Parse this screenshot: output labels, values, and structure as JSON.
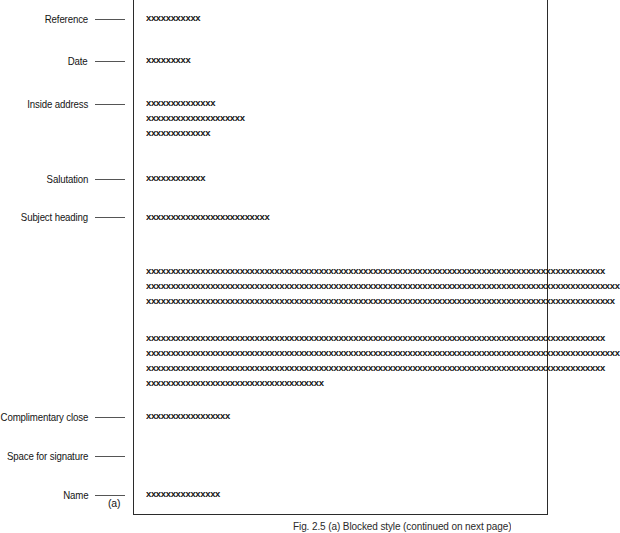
{
  "figure": {
    "subfigure_tag": "(a)",
    "caption": "Fig. 2.5 (a) Blocked style (continued on next page)",
    "line_color": "#555555",
    "border_color": "#2b2b2b",
    "text_color": "#151515"
  },
  "labels": [
    {
      "name": "reference",
      "text": "Reference",
      "top": 12
    },
    {
      "name": "date",
      "text": "Date",
      "top": 54
    },
    {
      "name": "inside-address",
      "text": "Inside address",
      "top": 97
    },
    {
      "name": "salutation",
      "text": "Salutation",
      "top": 172
    },
    {
      "name": "subject-heading",
      "text": "Subject heading",
      "top": 210
    },
    {
      "name": "complimentary-close",
      "text": "Complimentary close",
      "top": 410
    },
    {
      "name": "space-for-signature",
      "text": "Space for signature",
      "top": 449
    },
    {
      "name": "name",
      "text": "Name",
      "top": 488
    }
  ],
  "letter_lines": [
    {
      "name": "reference-line",
      "text": "xxxxxxxxxxx",
      "top": 14
    },
    {
      "name": "date-line",
      "text": "xxxxxxxxx",
      "top": 56
    },
    {
      "name": "inside-address-line-1",
      "text": "xxxxxxxxxxxxxx",
      "top": 99
    },
    {
      "name": "inside-address-line-2",
      "text": "xxxxxxxxxxxxxxxxxxxx",
      "top": 114
    },
    {
      "name": "inside-address-line-3",
      "text": "xxxxxxxxxxxxx",
      "top": 129
    },
    {
      "name": "salutation-line",
      "text": "xxxxxxxxxxxx",
      "top": 174
    },
    {
      "name": "subject-heading-line",
      "text": "xxxxxxxxxxxxxxxxxxxxxxxxx",
      "top": 213
    },
    {
      "name": "body1-line-1",
      "text": "xxxxxxxxxxxxxxxxxxxxxxxxxxxxxxxxxxxxxxxxxxxxxxxxxxxxxxxxxxxxxxxxxxxxxxxxxxxxxxxxxxxxxxxxxxxxx",
      "top": 267
    },
    {
      "name": "body1-line-2",
      "text": "xxxxxxxxxxxxxxxxxxxxxxxxxxxxxxxxxxxxxxxxxxxxxxxxxxxxxxxxxxxxxxxxxxxxxxxxxxxxxxxxxxxxxxxxxxxxxxxx",
      "top": 282
    },
    {
      "name": "body1-line-3",
      "text": "xxxxxxxxxxxxxxxxxxxxxxxxxxxxxxxxxxxxxxxxxxxxxxxxxxxxxxxxxxxxxxxxxxxxxxxxxxxxxxxxxxxxxxxxxxxxxxx",
      "top": 297
    },
    {
      "name": "body2-line-1",
      "text": "xxxxxxxxxxxxxxxxxxxxxxxxxxxxxxxxxxxxxxxxxxxxxxxxxxxxxxxxxxxxxxxxxxxxxxxxxxxxxxxxxxxxxxxxxxxxx",
      "top": 334
    },
    {
      "name": "body2-line-2",
      "text": "xxxxxxxxxxxxxxxxxxxxxxxxxxxxxxxxxxxxxxxxxxxxxxxxxxxxxxxxxxxxxxxxxxxxxxxxxxxxxxxxxxxxxxxxxxxxxxxx",
      "top": 349
    },
    {
      "name": "body2-line-3",
      "text": "xxxxxxxxxxxxxxxxxxxxxxxxxxxxxxxxxxxxxxxxxxxxxxxxxxxxxxxxxxxxxxxxxxxxxxxxxxxxxxxxxxxxxxxxxxxxx",
      "top": 364
    },
    {
      "name": "body2-line-4",
      "text": "xxxxxxxxxxxxxxxxxxxxxxxxxxxxxxxxxxxx",
      "top": 379
    },
    {
      "name": "complimentary-close-line",
      "text": "xxxxxxxxxxxxxxxxx",
      "top": 412
    },
    {
      "name": "name-line",
      "text": "xxxxxxxxxxxxxxx",
      "top": 490
    }
  ]
}
